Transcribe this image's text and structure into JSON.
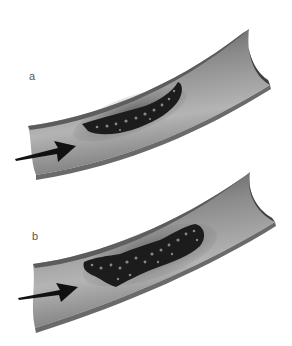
{
  "figure": {
    "panels": [
      {
        "label": "a",
        "description": "Opened vessel segment with elongated thrombus; arrow indicates flow direction"
      },
      {
        "label": "b",
        "description": "Opened vessel segment with larger, bulkier thrombus; arrow indicates flow direction"
      }
    ],
    "colors": {
      "background": "#ffffff",
      "vessel_light": "#a8a8a8",
      "vessel_dark": "#5a5a5a",
      "vessel_rim": "#6e6e6e",
      "thrombus": "#1c1c1c",
      "thrombus_highlight": "#9a9a9a",
      "arrow": "#111111",
      "label_text": "#555555"
    }
  }
}
